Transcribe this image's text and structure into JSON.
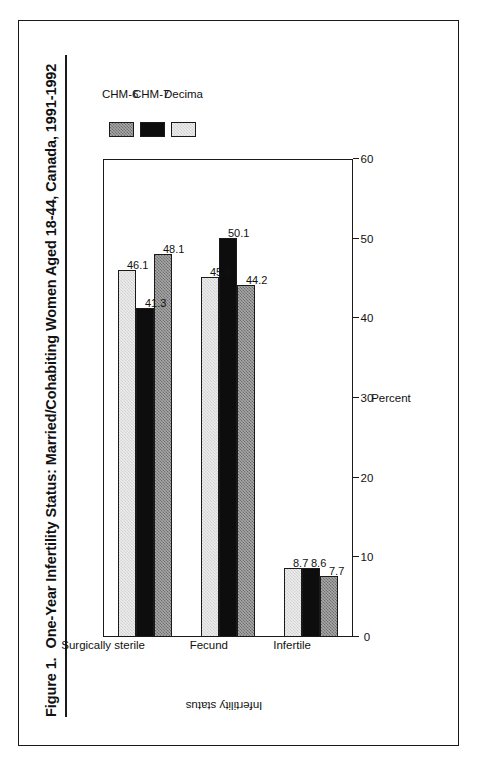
{
  "figure": {
    "number_label": "Figure 1.",
    "title": "One-Year Infertility Status:  Married/Cohabiting Women Aged 18-44, Canada, 1991-1992"
  },
  "legend": {
    "entries": [
      {
        "label": "CHM-6",
        "swatch": "dither-medium-gray",
        "color": "#a8a8a8"
      },
      {
        "label": "CHM-7",
        "swatch": "solid-black",
        "color": "#0d0d0d"
      },
      {
        "label": "Decima",
        "swatch": "dither-light-gray",
        "color": "#ececec"
      }
    ]
  },
  "chart_data": {
    "type": "bar",
    "orientation": "vertical",
    "xlabel": "Infertility status",
    "ylabel": "Percent",
    "categories": [
      "Infertile",
      "Fecund",
      "Surgically sterile"
    ],
    "series": [
      {
        "name": "CHM-6",
        "values": [
          7.7,
          44.2,
          48.1
        ]
      },
      {
        "name": "CHM-7",
        "values": [
          8.6,
          50.1,
          41.3
        ]
      },
      {
        "name": "Decima",
        "values": [
          8.7,
          45.2,
          46.1
        ]
      }
    ],
    "ylim": [
      0,
      60
    ],
    "yticks": [
      0,
      10,
      20,
      30,
      40,
      50,
      60
    ],
    "ytick_labels": [
      "0",
      "10",
      "20",
      "30",
      "40",
      "50",
      "60"
    ],
    "grid": false,
    "data_labels": true,
    "legend_position": "right"
  }
}
